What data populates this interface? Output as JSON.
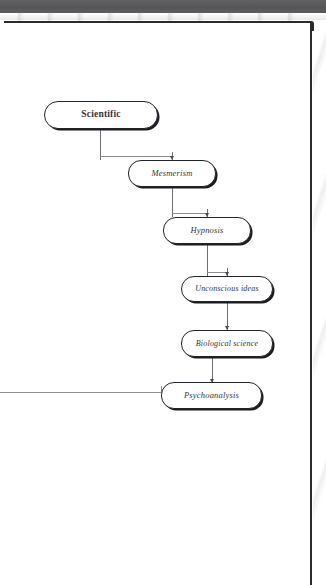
{
  "page": {
    "kind": "scanned-book-page-flowchart",
    "frame_color": "#2b2b2d",
    "scan_band_color": "#58585a",
    "background_color": "#ffffff"
  },
  "diagram": {
    "title": "",
    "orientation": "vertical-cascade",
    "node_fill": "#ffffff",
    "node_stroke": "#23232a",
    "connector_color": "#6e6e76",
    "nodes": [
      {
        "id": "scientific",
        "label": "Scientific",
        "emphasis": true,
        "x": 44,
        "y": 101,
        "w": 114,
        "h": 28
      },
      {
        "id": "mesmerism",
        "label": "Mesmerism",
        "emphasis": false,
        "x": 128,
        "y": 160,
        "w": 88,
        "h": 27
      },
      {
        "id": "hypnosis",
        "label": "Hypnosis",
        "emphasis": false,
        "x": 163,
        "y": 217,
        "w": 88,
        "h": 27
      },
      {
        "id": "unconscious-ideas",
        "label": "Unconscious ideas",
        "emphasis": false,
        "x": 181,
        "y": 276,
        "w": 92,
        "h": 26
      },
      {
        "id": "biological-science",
        "label": "Biological science",
        "emphasis": false,
        "x": 181,
        "y": 330,
        "w": 92,
        "h": 27
      },
      {
        "id": "psychoanalysis",
        "label": "Psychoanalysis",
        "emphasis": false,
        "x": 161,
        "y": 382,
        "w": 101,
        "h": 27
      }
    ],
    "edges": [
      {
        "id": "e1",
        "from": "scientific",
        "to": "mesmerism",
        "type": "elbow-down"
      },
      {
        "id": "e2",
        "from": "mesmerism",
        "to": "hypnosis",
        "type": "elbow-down"
      },
      {
        "id": "e3",
        "from": "hypnosis",
        "to": "unconscious-ideas",
        "type": "elbow-down"
      },
      {
        "id": "e4",
        "from": "unconscious-ideas",
        "to": "biological-science",
        "type": "straight-down"
      },
      {
        "id": "e5",
        "from": "biological-science",
        "to": "psychoanalysis",
        "type": "straight-down"
      },
      {
        "id": "e6",
        "from": "page-margin-left",
        "to": "psychoanalysis",
        "type": "horizontal-in"
      }
    ]
  }
}
